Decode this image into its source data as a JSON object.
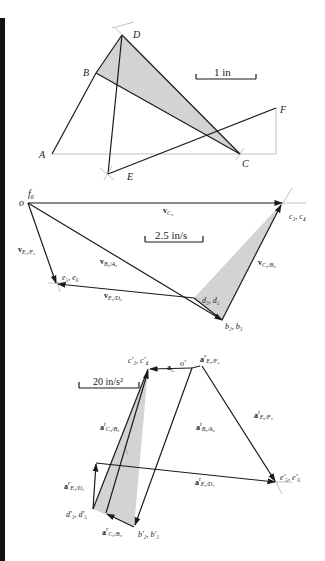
{
  "linkage": {
    "points": {
      "A": {
        "label": "A",
        "x": 52,
        "y": 154
      },
      "B": {
        "label": "B",
        "x": 96,
        "y": 73
      },
      "C": {
        "label": "C",
        "x": 240,
        "y": 154
      },
      "D": {
        "label": "D",
        "x": 122,
        "y": 35
      },
      "E": {
        "label": "E",
        "x": 108,
        "y": 174
      },
      "F": {
        "label": "F",
        "x": 276,
        "y": 108
      }
    },
    "scale_label": "1 in",
    "shaded_link": [
      "B",
      "D",
      "C"
    ]
  },
  "velocity_polygon": {
    "scale_label": "2.5 in/s",
    "points": {
      "o": {
        "label": "o",
        "x": 28,
        "y": 203
      },
      "f6": {
        "label": "f",
        "sub": "6"
      },
      "c3c4": {
        "label": "c₃, c₄",
        "x": 282,
        "y": 203
      },
      "e5e6": {
        "label": "e₅, e₆",
        "x": 57,
        "y": 284
      },
      "d3d5": {
        "label": "d₃, d₅",
        "x": 194,
        "y": 298
      },
      "b2b3": {
        "label": "b₂, b₃",
        "x": 222,
        "y": 320
      }
    },
    "vectors": [
      {
        "name": "v",
        "sub": "C₃",
        "from": "o",
        "to": "c3c4"
      },
      {
        "name": "v",
        "sub": "B₂/A₂",
        "from": "o",
        "to": "b2b3"
      },
      {
        "name": "v",
        "sub": "E₆/F₆",
        "from": "o",
        "to": "e5e6"
      },
      {
        "name": "v",
        "sub": "C₃/B₃",
        "from": "b2b3",
        "to": "c3c4"
      },
      {
        "name": "v",
        "sub": "E₅/D₅",
        "from": "d3d5",
        "to": "e5e6"
      }
    ]
  },
  "acceleration_polygon": {
    "scale_label": "20 in/s²",
    "points": {
      "o_prime": {
        "label": "o′",
        "x": 192,
        "y": 368
      },
      "c3c4": {
        "label": "c′₃, c′₄",
        "x": 148,
        "y": 369
      },
      "tip_top": {
        "x": 202,
        "y": 366
      },
      "e5e6": {
        "label": "e′₅, e′₆",
        "x": 276,
        "y": 482
      },
      "d3d5": {
        "label": "d′₃, d′₅",
        "x": 93,
        "y": 509
      },
      "b2b3": {
        "label": "b′₂, b′₃",
        "x": 134,
        "y": 527
      },
      "cb_mid": {
        "x": 106,
        "y": 513
      },
      "ed_base": {
        "x": 96,
        "y": 463
      }
    },
    "vectors": [
      {
        "name": "a",
        "sup": "",
        "sub": "C",
        "label": "a_C"
      },
      {
        "name": "a",
        "sup": "r",
        "sub": "E₆/F₆",
        "label": "a^r_E6/F6"
      },
      {
        "name": "a",
        "sup": "t",
        "sub": "E₆/F₆",
        "label": "a^t_E6/F6"
      },
      {
        "name": "a",
        "sup": "t",
        "sub": "B₂/A₂",
        "label": "a^t_B2/A2"
      },
      {
        "name": "a",
        "sup": "t",
        "sub": "C₃/B₃",
        "label": "a^t_C3/B3"
      },
      {
        "name": "a",
        "sup": "r",
        "sub": "E₅/D₅",
        "label": "a^r_E5/D5"
      },
      {
        "name": "a",
        "sup": "t",
        "sub": "E₅/D₅",
        "label": "a^t_E5/D5"
      },
      {
        "name": "a",
        "sup": "r",
        "sub": "C₃/B₃",
        "label": "a^r_C3/B3"
      }
    ]
  },
  "colors": {
    "line": "#1a1a1a",
    "shade": "#d3d3d3",
    "construction": "#999999",
    "left_bar": "#111111"
  }
}
